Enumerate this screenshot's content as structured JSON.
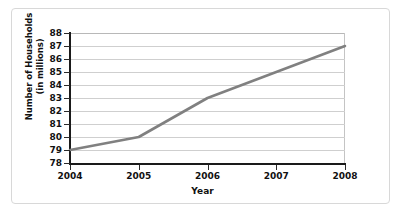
{
  "chart_data": {
    "type": "line",
    "title": "",
    "subtitle": "",
    "xlabel": "Year",
    "ylabel": "Number of Households\n(in millions)",
    "ylabel_line1": "Number of Households",
    "ylabel_line2": "(in millions)",
    "x": [
      2004,
      2005,
      2006,
      2007,
      2008
    ],
    "xtick_labels": [
      "2004",
      "2005",
      "2006",
      "2007",
      "2008"
    ],
    "ytick_labels": [
      "88",
      "87",
      "86",
      "85",
      "84",
      "83",
      "82",
      "81",
      "80",
      "79",
      "78"
    ],
    "yticks": [
      88,
      87,
      86,
      85,
      84,
      83,
      82,
      81,
      80,
      79,
      78
    ],
    "xlim": [
      2004,
      2008
    ],
    "ylim": [
      78,
      88
    ],
    "grid": "horizontal",
    "legend": "none",
    "series": [
      {
        "name": "Number of Households",
        "values": [
          79,
          80,
          83,
          85,
          87
        ]
      }
    ],
    "annotations": [],
    "colors": {
      "line": "#808080",
      "gridline": "#cfcfcf",
      "axis": "#1a1a1a",
      "background": "#ffffff",
      "frame_border": "#d8d8d8",
      "text": "#111111"
    }
  }
}
